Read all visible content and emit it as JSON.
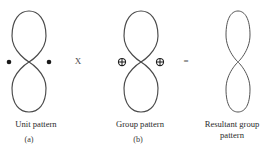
{
  "diagram": {
    "line_color": "#4a4a4a",
    "marker_color": "#1a1a1a",
    "panels": [
      {
        "id": "unit-pattern",
        "caption": "Unit pattern",
        "sublabel": "(a)",
        "shape": "figure-eight-lemniscate",
        "markers": "filled-dot",
        "marker_symbol": "●",
        "marker_count": 2,
        "center_x": 29,
        "lobe_half_width": 17,
        "top_y": 11,
        "bottom_y": 112,
        "waist_y": 62,
        "stroke_width": 1.15
      },
      {
        "id": "group-pattern",
        "caption": "Group pattern",
        "sublabel": "(b)",
        "shape": "figure-eight-lemniscate",
        "markers": "circled-plus",
        "marker_symbol": "⊕",
        "marker_count": 2,
        "center_x": 141,
        "lobe_half_width": 17,
        "top_y": 11,
        "bottom_y": 112,
        "waist_y": 62,
        "stroke_width": 1.15
      },
      {
        "id": "resultant-group-pattern",
        "caption": "Resultant group\npattern",
        "sublabel": "",
        "shape": "figure-eight-lemniscate",
        "markers": "none",
        "marker_symbol": "",
        "marker_count": 0,
        "center_x": 238,
        "lobe_half_width": 12,
        "top_y": 11,
        "bottom_y": 112,
        "waist_y": 62,
        "stroke_width": 0.95
      }
    ],
    "operators": [
      {
        "id": "multiply",
        "symbol": "X"
      },
      {
        "id": "equals",
        "symbol": "="
      }
    ]
  }
}
